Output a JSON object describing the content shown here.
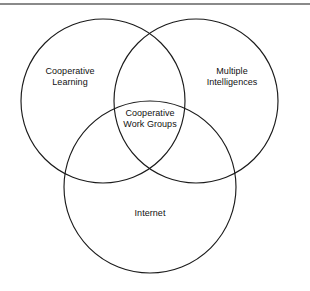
{
  "figure": {
    "type": "venn-diagram",
    "set_count": 3,
    "background_color": "#ffffff",
    "stroke_color": "#1b1b1b",
    "text_color": "#111111",
    "rule_color": "#8a8a8a"
  },
  "divider": {
    "name": "top-horizontal-rule"
  },
  "circles": [
    {
      "id": "cooperative-learning",
      "cx": 103,
      "cy": 101,
      "r": 82
    },
    {
      "id": "multiple-intelligences",
      "cx": 196,
      "cy": 101,
      "r": 82
    },
    {
      "id": "internet",
      "cx": 150,
      "cy": 187,
      "r": 86
    }
  ],
  "labels": {
    "cooperative_learning": {
      "line1": "Cooperative",
      "line2": "Learning"
    },
    "multiple_intelligences": {
      "line1": "Multiple",
      "line2": "Intelligences"
    },
    "cooperative_work_groups": {
      "line1": "Cooperative",
      "line2": "Work Groups"
    },
    "internet": {
      "line1": "Internet"
    }
  }
}
